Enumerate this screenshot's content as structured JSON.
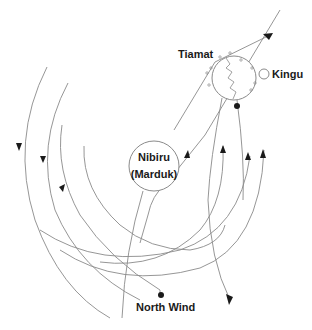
{
  "diagram": {
    "title": "",
    "colors": {
      "line": "#8a8a8a",
      "arrow": "#1a1a1a",
      "text": "#1a1a1a",
      "background": "#ffffff"
    },
    "labels": {
      "tiamat": "Tiamat",
      "kingu": "Kingu",
      "nibiru": "Nibiru",
      "marduk": "(Marduk)",
      "north_wind": "North Wind"
    },
    "bodies": [
      {
        "id": "nibiru",
        "label": "Nibiru (Marduk)",
        "cx": 154,
        "cy": 166,
        "r": 25
      },
      {
        "id": "tiamat",
        "label": "Tiamat",
        "cx": 234,
        "cy": 78,
        "r": 22,
        "note": "cracked body with zig-zag fissure, surrounded by small debris"
      },
      {
        "id": "kingu",
        "label": "Kingu",
        "cx": 264,
        "cy": 74,
        "r": 5
      }
    ],
    "points": [
      {
        "id": "north-wind-point",
        "label": "North Wind",
        "x": 160,
        "y": 295
      },
      {
        "id": "tiamat-point",
        "x": 237,
        "y": 106
      }
    ],
    "orbits": [
      {
        "id": "orbit-outer-left",
        "direction": "down"
      },
      {
        "id": "orbit-mid-left",
        "direction": "down"
      },
      {
        "id": "orbit-inner-left",
        "direction": "down"
      },
      {
        "id": "orbit-innermost",
        "direction": "none"
      },
      {
        "id": "orbit-right-1",
        "direction": "up"
      },
      {
        "id": "orbit-right-2",
        "direction": "up"
      },
      {
        "id": "orbit-right-3",
        "direction": "up"
      }
    ],
    "paths": [
      {
        "id": "diagonal-path",
        "description": "line from Nibiru up-right through Tiamat, arrows pointing up-right"
      },
      {
        "id": "descending-path",
        "description": "line from Tiamat down to bottom, arrow pointing down"
      }
    ]
  }
}
